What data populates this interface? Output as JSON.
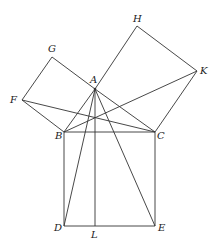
{
  "diagram": {
    "stroke_color": "#333333",
    "points": {
      "A": {
        "x": 95,
        "y": 89
      },
      "B": {
        "x": 64,
        "y": 132
      },
      "C": {
        "x": 155,
        "y": 132
      },
      "D": {
        "x": 64,
        "y": 226
      },
      "E": {
        "x": 155,
        "y": 226
      },
      "L": {
        "x": 95,
        "y": 226
      },
      "G": {
        "x": 52,
        "y": 57
      },
      "F": {
        "x": 22,
        "y": 100
      },
      "H": {
        "x": 137,
        "y": 26
      },
      "K": {
        "x": 197,
        "y": 71
      }
    },
    "labels": [
      {
        "text": "A",
        "x": 90,
        "y": 75
      },
      {
        "text": "B",
        "x": 55,
        "y": 131
      },
      {
        "text": "C",
        "x": 157,
        "y": 131
      },
      {
        "text": "D",
        "x": 54,
        "y": 223
      },
      {
        "text": "E",
        "x": 158,
        "y": 223
      },
      {
        "text": "L",
        "x": 91,
        "y": 230
      },
      {
        "text": "G",
        "x": 48,
        "y": 44
      },
      {
        "text": "F",
        "x": 10,
        "y": 95
      },
      {
        "text": "H",
        "x": 133,
        "y": 14
      },
      {
        "text": "K",
        "x": 200,
        "y": 66
      }
    ],
    "segments": [
      [
        "A",
        "B"
      ],
      [
        "A",
        "C"
      ],
      [
        "B",
        "C"
      ],
      [
        "B",
        "D"
      ],
      [
        "D",
        "E"
      ],
      [
        "E",
        "C"
      ],
      [
        "A",
        "G"
      ],
      [
        "G",
        "F"
      ],
      [
        "F",
        "B"
      ],
      [
        "A",
        "H"
      ],
      [
        "H",
        "K"
      ],
      [
        "K",
        "C"
      ],
      [
        "A",
        "D"
      ],
      [
        "A",
        "E"
      ],
      [
        "A",
        "L"
      ],
      [
        "F",
        "C"
      ],
      [
        "B",
        "K"
      ]
    ]
  }
}
